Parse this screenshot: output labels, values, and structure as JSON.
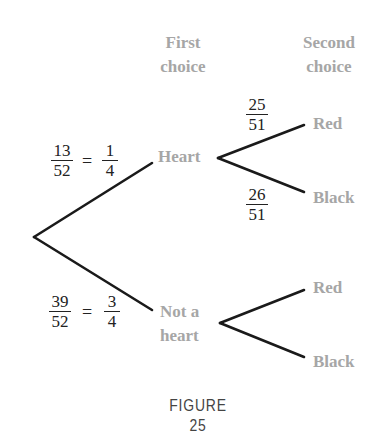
{
  "headers": {
    "first": {
      "line1": "First",
      "line2": "choice"
    },
    "second": {
      "line1": "Second",
      "line2": "choice"
    }
  },
  "nodes": {
    "heart": "Heart",
    "not_heart_line1": "Not a",
    "not_heart_line2": "heart",
    "heart_red": "Red",
    "heart_black": "Black",
    "not_heart_red": "Red",
    "not_heart_black": "Black"
  },
  "probabilities": {
    "heart": {
      "num": "13",
      "den": "52",
      "eq": "=",
      "simp_num": "1",
      "simp_den": "4"
    },
    "not_heart": {
      "num": "39",
      "den": "52",
      "eq": "=",
      "simp_num": "3",
      "simp_den": "4"
    },
    "heart_red": {
      "num": "25",
      "den": "51"
    },
    "heart_black": {
      "num": "26",
      "den": "51"
    }
  },
  "caption": "FIGURE 25",
  "colors": {
    "line": "#1a1a1a",
    "label_gray": "#a6a6a6",
    "text": "#222222"
  }
}
